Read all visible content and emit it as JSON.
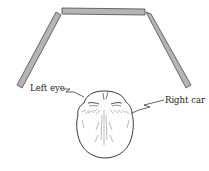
{
  "diagram": {
    "type": "three-way mirror arrangement, top view of head",
    "mirrors": [
      {
        "name": "left-mirror"
      },
      {
        "name": "center-mirror"
      },
      {
        "name": "right-mirror"
      }
    ],
    "labels": {
      "left": "Left eye",
      "right": "Right car"
    },
    "colors": {
      "mirror_fill": "#b5b5b5",
      "mirror_stroke": "#4a4a4a",
      "line": "#222222"
    }
  }
}
